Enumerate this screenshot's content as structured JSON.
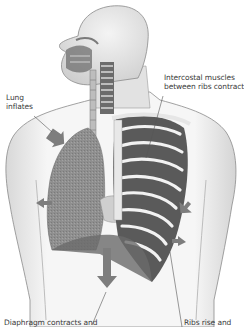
{
  "diagram": {
    "colors": {
      "background": "#ffffff",
      "body_fill": "#f1f1f1",
      "body_outline": "#8a8a8a",
      "lung": "#8e8e8e",
      "rib": "#f4f4f4",
      "intercostal": "#5a5a5a",
      "arrow": "#7d7d7d",
      "label_text": "#3a3a3a",
      "leader_line": "#555555"
    },
    "labels": [
      {
        "id": "lung",
        "lines": [
          "Lung",
          "inflates"
        ]
      },
      {
        "id": "intercostal",
        "lines": [
          "Intercostal muscles",
          "between ribs contract"
        ]
      },
      {
        "id": "diaphragm",
        "lines": [
          "Diaphragm contracts and"
        ]
      },
      {
        "id": "ribs",
        "lines": [
          "Ribs rise and"
        ]
      }
    ],
    "arrows": [
      {
        "id": "lung-arrow",
        "direction": "down-right"
      },
      {
        "id": "side-left-arrow",
        "direction": "left"
      },
      {
        "id": "diaphragm-arrow",
        "direction": "down"
      },
      {
        "id": "ribs-up-arrow",
        "direction": "up-right"
      },
      {
        "id": "ribs-lower-arrow",
        "direction": "right"
      }
    ]
  }
}
